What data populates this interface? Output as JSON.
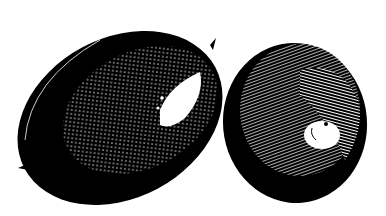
{
  "image": {
    "description": "Black and white engraving-style illustration of two citrus fruits (lemons/limes)",
    "background": "#ffffff",
    "ink": "#000000",
    "subjects": [
      {
        "name": "left-fruit",
        "shape": "oval lemon with pointed tips",
        "highlight": "upper right"
      },
      {
        "name": "right-fruit",
        "shape": "round lime",
        "highlight": "center right with stem end"
      }
    ]
  }
}
